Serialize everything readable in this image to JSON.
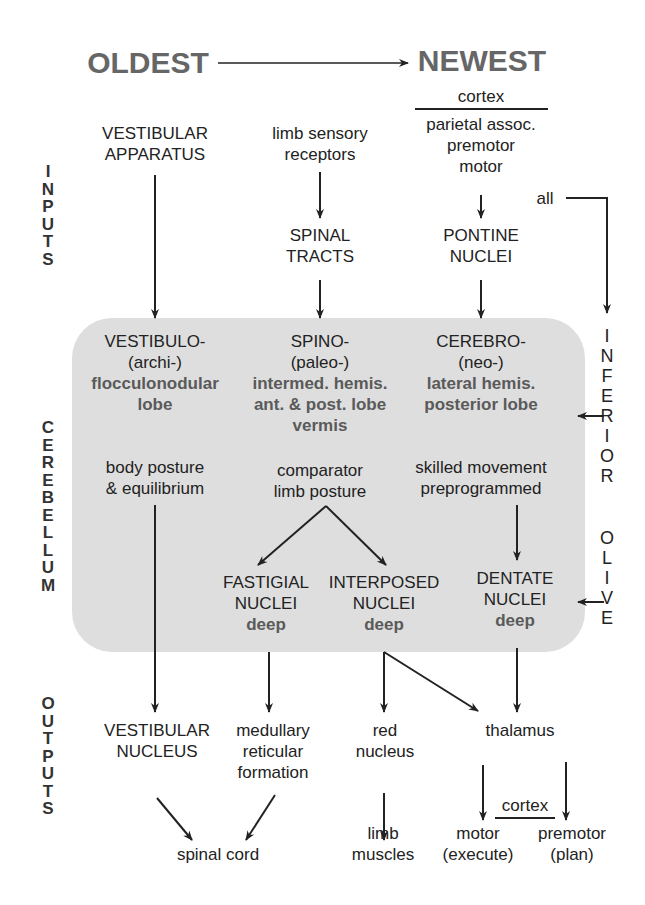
{
  "header": {
    "oldest": "OLDEST",
    "newest": "NEWEST"
  },
  "side_labels": {
    "inputs": [
      "I",
      "N",
      "P",
      "U",
      "T",
      "S"
    ],
    "cerebellum": [
      "C",
      "E",
      "R",
      "E",
      "B",
      "E",
      "L",
      "L",
      "U",
      "M"
    ],
    "outputs": [
      "O",
      "U",
      "T",
      "P",
      "U",
      "T",
      "S"
    ]
  },
  "right_label": {
    "word1": [
      "I",
      "N",
      "F",
      "E",
      "R",
      "I",
      "O",
      "R"
    ],
    "word2": [
      "O",
      "L",
      "I",
      "V",
      "E"
    ],
    "all": "all"
  },
  "inputs": {
    "vestibular": [
      "VESTIBULAR",
      "APPARATUS"
    ],
    "limb": [
      "limb sensory",
      "receptors"
    ],
    "spinal_tracts": [
      "SPINAL",
      "TRACTS"
    ],
    "cortex_header": "cortex",
    "cortex_areas": [
      "parietal assoc.",
      "premotor",
      "motor"
    ],
    "pontine": [
      "PONTINE",
      "NUCLEI"
    ]
  },
  "cerebellum": {
    "vestibulo": {
      "name": "VESTIBULO-",
      "alt": "(archi-)",
      "region": [
        "flocculonodular",
        "lobe"
      ],
      "function": [
        "body posture",
        "& equilibrium"
      ]
    },
    "spino": {
      "name": "SPINO-",
      "alt": "(paleo-)",
      "region": [
        "intermed. hemis.",
        "ant. & post. lobe",
        "vermis"
      ],
      "function": [
        "comparator",
        "limb posture"
      ]
    },
    "cerebro": {
      "name": "CEREBRO-",
      "alt": "(neo-)",
      "region": [
        "lateral hemis.",
        "posterior lobe"
      ],
      "function": [
        "skilled movement",
        "preprogrammed"
      ]
    },
    "nuclei": {
      "fastigial": [
        "FASTIGIAL",
        "NUCLEI",
        "deep"
      ],
      "interposed": [
        "INTERPOSED",
        "NUCLEI",
        "deep"
      ],
      "dentate": [
        "DENTATE",
        "NUCLEI",
        "deep"
      ]
    }
  },
  "outputs": {
    "vestibular_nucleus": [
      "VESTIBULAR",
      "NUCLEUS"
    ],
    "medullary": [
      "medullary",
      "reticular",
      "formation"
    ],
    "red_nucleus": [
      "red",
      "nucleus"
    ],
    "thalamus": "thalamus",
    "spinal_cord": "spinal cord",
    "limb_muscles": [
      "limb",
      "muscles"
    ],
    "cortex_header": "cortex",
    "motor": [
      "motor",
      "(execute)"
    ],
    "premotor": [
      "premotor",
      "(plan)"
    ]
  },
  "colors": {
    "box_fill": "#dedede",
    "text": "#222222",
    "bold_text": "#5a5a5a",
    "header_text": "#666666"
  }
}
